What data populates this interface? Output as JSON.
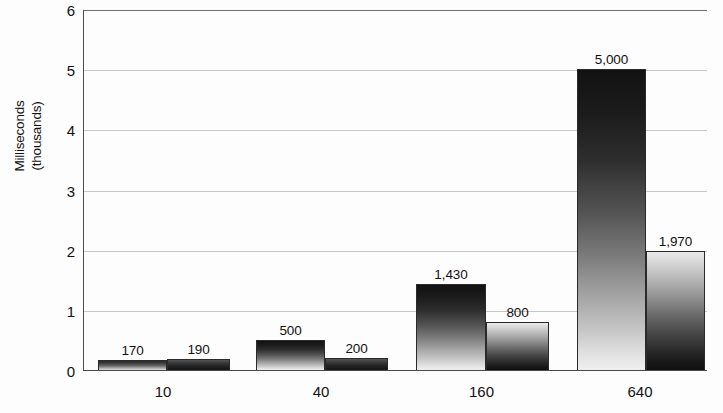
{
  "chart_data": {
    "type": "bar",
    "title": "",
    "xlabel": "",
    "ylabel": "Milliseconds (thousands)",
    "ylabel_line1": "Milliseconds",
    "ylabel_line2": "(thousands)",
    "categories": [
      "10",
      "40",
      "160",
      "640"
    ],
    "ylim": [
      0,
      6
    ],
    "yticks": [
      "0",
      "1",
      "2",
      "3",
      "4",
      "5",
      "6"
    ],
    "ytick_values": [
      0,
      1,
      2,
      3,
      4,
      5,
      6
    ],
    "grid": true,
    "legend": "none",
    "value_units": "milliseconds",
    "series": [
      {
        "name": "series-1",
        "values": [
          170,
          500,
          1430,
          5000
        ],
        "labels": [
          "170",
          "500",
          "1,430",
          "5,000"
        ],
        "fill": "gradient-dark-top-to-light-bottom"
      },
      {
        "name": "series-2",
        "values": [
          190,
          200,
          800,
          1970
        ],
        "labels": [
          "190",
          "200",
          "800",
          "1,970"
        ],
        "fill": "gradient-light-top-to-dark-bottom"
      }
    ],
    "colors": {
      "background": "#fdfdfd",
      "gridline": "#c8c8c8",
      "axis": "#4a4a4a",
      "text": "#111111",
      "bar_dark": "#121212",
      "bar_light": "#e9e9e9"
    }
  }
}
